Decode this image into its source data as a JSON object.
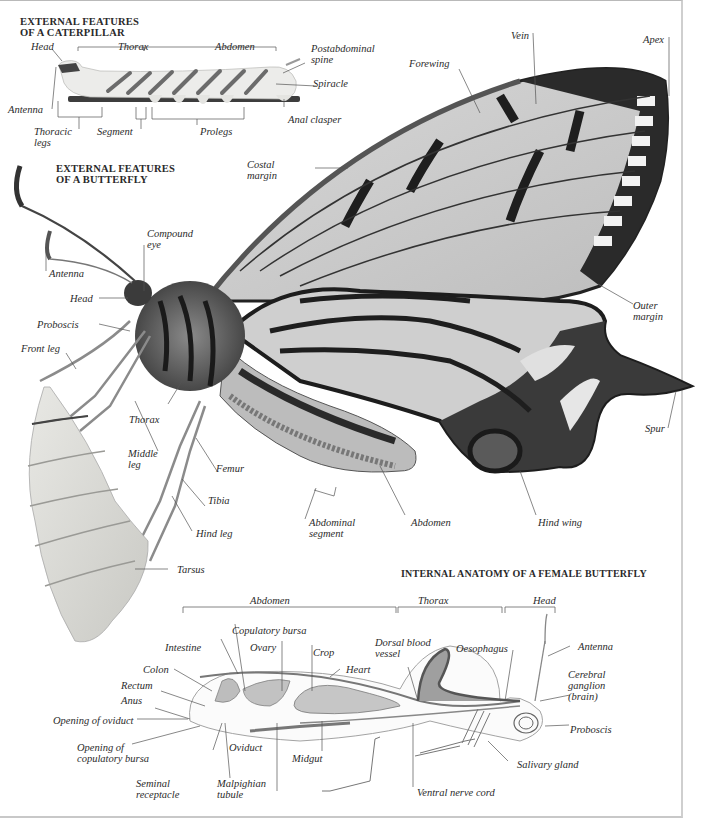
{
  "caterpillar": {
    "heading_line1": "EXTERNAL FEATURES",
    "heading_line2": "OF A CATERPILLAR",
    "labels": {
      "head": "Head",
      "thorax": "Thorax",
      "abdomen": "Abdomen",
      "postabdominal_spine_1": "Postabdominal",
      "postabdominal_spine_2": "spine",
      "spiracle": "Spiracle",
      "antenna": "Antenna",
      "anal_clasper": "Anal clasper",
      "thoracic_legs_1": "Thoracic",
      "thoracic_legs_2": "legs",
      "segment": "Segment",
      "prolegs": "Prolegs"
    }
  },
  "butterfly": {
    "heading_line1": "EXTERNAL FEATURES",
    "heading_line2": "OF A BUTTERFLY",
    "labels": {
      "vein": "Vein",
      "apex": "Apex",
      "forewing": "Forewing",
      "costal_margin_1": "Costal",
      "costal_margin_2": "margin",
      "compound_eye_1": "Compound",
      "compound_eye_2": "eye",
      "antenna": "Antenna",
      "head": "Head",
      "proboscis": "Proboscis",
      "front_leg": "Front leg",
      "thorax": "Thorax",
      "middle_leg_1": "Middle",
      "middle_leg_2": "leg",
      "femur": "Femur",
      "tibia": "Tibia",
      "hind_leg": "Hind leg",
      "tarsus": "Tarsus",
      "outer_margin_1": "Outer",
      "outer_margin_2": "margin",
      "spur": "Spur",
      "abdominal_segment_1": "Abdominal",
      "abdominal_segment_2": "segment",
      "abdomen": "Abdomen",
      "hind_wing": "Hind wing"
    }
  },
  "internal": {
    "heading": "INTERNAL ANATOMY OF A FEMALE BUTTERFLY",
    "regions": {
      "abdomen": "Abdomen",
      "thorax": "Thorax",
      "head": "Head"
    },
    "labels": {
      "copulatory_bursa": "Copulatory bursa",
      "intestine": "Intestine",
      "ovary": "Ovary",
      "crop": "Crop",
      "heart": "Heart",
      "dorsal_blood_vessel_1": "Dorsal blood",
      "dorsal_blood_vessel_2": "vessel",
      "oesophagus": "Oesophagus",
      "antenna": "Antenna",
      "colon": "Colon",
      "rectum": "Rectum",
      "anus": "Anus",
      "cerebral_ganglion_1": "Cerebral",
      "cerebral_ganglion_2": "ganglion",
      "cerebral_ganglion_3": "(brain)",
      "opening_of_oviduct": "Opening of oviduct",
      "proboscis": "Proboscis",
      "opening_of_copulatory_bursa_1": "Opening of",
      "opening_of_copulatory_bursa_2": "copulatory bursa",
      "oviduct": "Oviduct",
      "midgut": "Midgut",
      "salivary_gland": "Salivary gland",
      "seminal_receptacle_1": "Seminal",
      "seminal_receptacle_2": "receptacle",
      "malpighian_tubule_1": "Malpighian",
      "malpighian_tubule_2": "tubule",
      "ventral_nerve_cord": "Ventral nerve cord"
    }
  }
}
